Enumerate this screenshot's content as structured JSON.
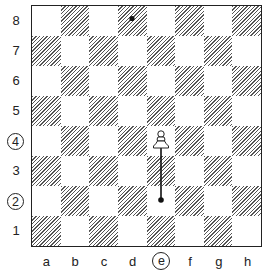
{
  "diagram": {
    "type": "chess-board",
    "ranks": [
      "8",
      "7",
      "6",
      "5",
      "4",
      "3",
      "2",
      "1"
    ],
    "files": [
      "a",
      "b",
      "c",
      "d",
      "e",
      "f",
      "g",
      "h"
    ],
    "circled_ranks": [
      "4",
      "2"
    ],
    "circled_files": [
      "e"
    ],
    "pieces": [
      {
        "piece": "white-pawn",
        "square": "e4"
      }
    ],
    "markers": [
      {
        "type": "dot",
        "square": "d8"
      },
      {
        "type": "move-line",
        "from": "e2",
        "to": "e4",
        "start_marker": "dot"
      }
    ],
    "colors": {
      "board_border": "#222222",
      "hatch": "#555555",
      "light_square": "#ffffff"
    }
  }
}
